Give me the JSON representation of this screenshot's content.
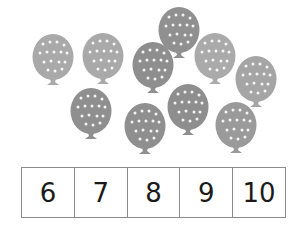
{
  "balloons": [
    {
      "cx": 53,
      "cy": 57,
      "color": "#a9a9a9"
    },
    {
      "cx": 103,
      "cy": 56,
      "color": "#a9a9a9"
    },
    {
      "cx": 179,
      "cy": 30,
      "color": "#909090"
    },
    {
      "cx": 153,
      "cy": 65,
      "color": "#8e8e8e"
    },
    {
      "cx": 215,
      "cy": 56,
      "color": "#aaaaaa"
    },
    {
      "cx": 256,
      "cy": 79,
      "color": "#a5a5a5"
    },
    {
      "cx": 91,
      "cy": 111,
      "color": "#8f8f8f"
    },
    {
      "cx": 145,
      "cy": 126,
      "color": "#8f8f8f"
    },
    {
      "cx": 188,
      "cy": 107,
      "color": "#8e8e8e"
    },
    {
      "cx": 236,
      "cy": 125,
      "color": "#9a9a9a"
    }
  ],
  "balloon_count": 10,
  "number_choices": [
    "6",
    "7",
    "8",
    "9",
    "10"
  ],
  "colors": {
    "border": "#8c8c8c",
    "text": "#1a1a1a",
    "dot": "#ffffff"
  }
}
